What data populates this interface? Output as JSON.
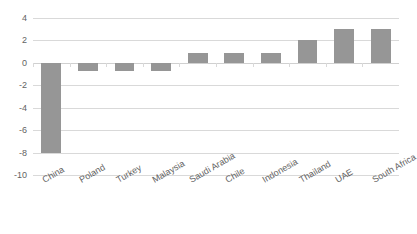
{
  "chart_data": {
    "type": "bar",
    "title": "",
    "subtitle": "",
    "xlabel": "",
    "ylabel": "",
    "categories": [
      "China",
      "Poland",
      "Turkey",
      "Malaysia",
      "Saudi Arabia",
      "Chile",
      "Indonesia",
      "Thailand",
      "UAE",
      "South Africa"
    ],
    "values": [
      -8.0,
      -0.7,
      -0.7,
      -0.7,
      0.9,
      0.9,
      0.9,
      2.0,
      3.0,
      3.0
    ],
    "ylim": [
      -10,
      4
    ],
    "yticks": [
      4,
      2,
      0,
      -2,
      -4,
      -6,
      -8,
      -10
    ],
    "ytick_labels": [
      "4",
      "2",
      "0",
      "-2",
      "-4",
      "-6",
      "-8",
      "-10"
    ],
    "grid": true,
    "legend": false,
    "legend_position": "none",
    "bar_color": "#969696",
    "gridline_color": "#d9d9d9",
    "label_rotation_deg": -30
  }
}
